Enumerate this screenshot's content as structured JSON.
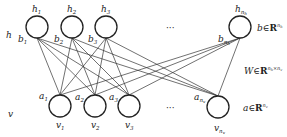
{
  "diagram": {
    "type": "restricted-boltzmann-machine",
    "layers": {
      "hidden": {
        "label": "h",
        "nodes": [
          {
            "name": "h",
            "sub": "1",
            "bias": "b",
            "bias_sub": "1",
            "x": 37
          },
          {
            "name": "h",
            "sub": "2",
            "bias": "b",
            "bias_sub": "2",
            "x": 72
          },
          {
            "name": "h",
            "sub": "3",
            "bias": "b",
            "bias_sub": "3",
            "x": 106
          },
          {
            "name": "h",
            "sub": "n_h",
            "bias": "b",
            "bias_sub": "n_h",
            "x": 240
          }
        ],
        "ellipsis": "···",
        "param": {
          "var": "b",
          "in": "∈",
          "space": "R",
          "sup": "n_h"
        }
      },
      "visible": {
        "label": "v",
        "nodes": [
          {
            "name": "v",
            "sub": "1",
            "bias": "a",
            "bias_sub": "1",
            "x": 60
          },
          {
            "name": "v",
            "sub": "2",
            "bias": "a",
            "bias_sub": "2",
            "x": 95
          },
          {
            "name": "v",
            "sub": "3",
            "bias": "a",
            "bias_sub": "3",
            "x": 129
          },
          {
            "name": "v",
            "sub": "n_v",
            "bias": "a",
            "bias_sub": "n_v",
            "x": 218
          }
        ],
        "ellipsis": "···",
        "param": {
          "var": "a",
          "in": "∈",
          "space": "R",
          "sup": "n_v"
        }
      }
    },
    "weights": {
      "var": "W",
      "in": "∈",
      "space": "R",
      "sup": "n_h×n_v"
    },
    "colors": {
      "stroke": "#222222",
      "background": "#ffffff"
    }
  }
}
